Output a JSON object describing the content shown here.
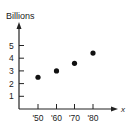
{
  "chart_data": {
    "type": "scatter",
    "title": "",
    "ylabel": "Billions",
    "xlabel": "x",
    "categories": [
      "'50",
      "'60",
      "'70",
      "'80"
    ],
    "x": [
      1950,
      1960,
      1970,
      1980
    ],
    "values": [
      2.5,
      3.0,
      3.6,
      4.4
    ],
    "yticks": [
      "1",
      "2",
      "3",
      "4",
      "5"
    ],
    "ylim": [
      0,
      6
    ],
    "grid": false,
    "legend": null
  },
  "colors": {
    "axis": "#222222",
    "point": "#111111",
    "background": "#ffffff"
  }
}
